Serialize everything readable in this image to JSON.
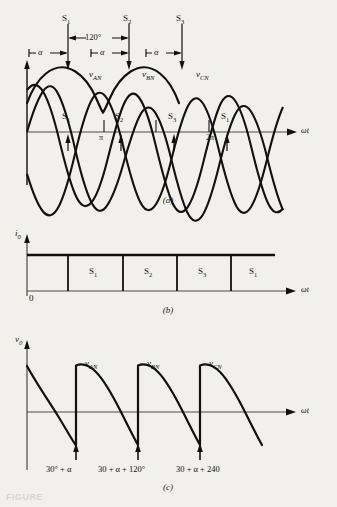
{
  "figure": {
    "background_color": "#f2f0ec",
    "line_color": "#111111",
    "axis_label_omega_t": "ωt",
    "panels": [
      {
        "id": "a",
        "label": "(a)",
        "y_axis_label": "",
        "description": "Three-phase source voltages with thyristor firing instants",
        "top_markers": [
          "S",
          "S",
          "S"
        ],
        "top_marker_subs": [
          "1",
          "2",
          "3"
        ],
        "dimension_120": "120°",
        "alpha_labels": [
          "α",
          "α",
          "α"
        ],
        "wave_labels": [
          "v",
          "v",
          "v"
        ],
        "wave_label_subs": [
          "AN",
          "BN",
          "CN"
        ],
        "axis_markers": [
          "π",
          "2π"
        ],
        "inline_switch_labels": [
          "S",
          "S",
          "S",
          "S"
        ],
        "inline_switch_subs": [
          "1",
          "2",
          "3",
          "1"
        ]
      },
      {
        "id": "b",
        "label": "(b)",
        "y_axis_label": "i",
        "y_axis_label_sub": "0",
        "origin_label": "0",
        "segments": [
          "S",
          "S",
          "S",
          "S"
        ],
        "segment_subs": [
          "1",
          "2",
          "3",
          "1"
        ],
        "description": "Constant output current i0 with conduction intervals"
      },
      {
        "id": "c",
        "label": "(c)",
        "y_axis_label": "v",
        "y_axis_label_sub": "0",
        "wave_labels": [
          "v",
          "v",
          "v"
        ],
        "wave_label_subs": [
          "AN",
          "BN",
          "CN"
        ],
        "firing_annotations": [
          "30° + α",
          "30 + α + 120°",
          "30 + α + 240"
        ],
        "description": "Output voltage waveform with firing angle annotations"
      }
    ],
    "caption_partial": "FIGURE"
  }
}
